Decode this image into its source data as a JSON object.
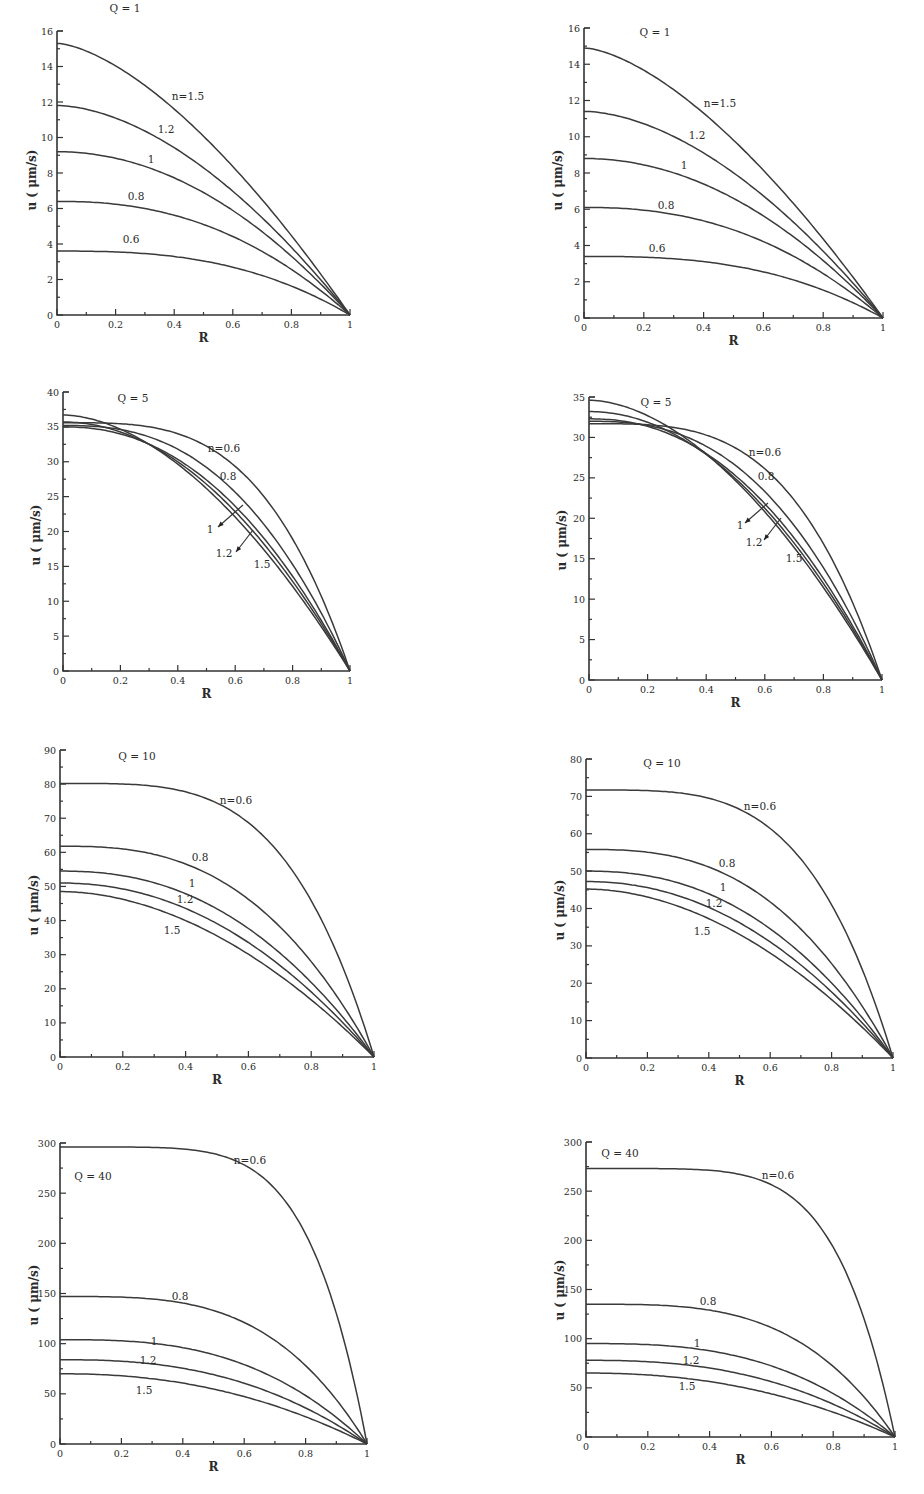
{
  "figure": {
    "layout": "4 rows x 2 columns of line plots",
    "x_axis_label": "R",
    "y_axis_label": "u ( μm/s)"
  },
  "chart_data": [
    {
      "type": "line",
      "panel": "row1-left",
      "title": "Q = 1",
      "xlabel": "R",
      "ylabel": "u ( μm/s)",
      "xlim": [
        0,
        1
      ],
      "ylim": [
        0,
        16
      ],
      "xticks": [
        "0",
        "0.2",
        "0.4",
        "0.6",
        "0.8",
        "1"
      ],
      "yticks": [
        "0",
        "2",
        "4",
        "6",
        "8",
        "10",
        "12",
        "14",
        "16"
      ],
      "grid": false,
      "series": [
        {
          "name": "n=1.5",
          "label": "n=1.5",
          "u0": 15.3,
          "k": 1.55,
          "x": [
            0,
            0.2,
            0.4,
            0.6,
            0.8,
            1
          ],
          "values": [
            15.3,
            14.2,
            12.0,
            8.9,
            4.9,
            0
          ]
        },
        {
          "name": "n=1.2",
          "label": "1.2",
          "u0": 11.8,
          "k": 1.75,
          "x": [
            0,
            0.2,
            0.4,
            0.6,
            0.8,
            1
          ],
          "values": [
            11.8,
            11.1,
            9.6,
            7.2,
            4.0,
            0
          ]
        },
        {
          "name": "n=1",
          "label": "1",
          "u0": 9.2,
          "k": 2.0,
          "x": [
            0,
            0.2,
            0.4,
            0.6,
            0.8,
            1
          ],
          "values": [
            9.2,
            8.8,
            7.7,
            5.9,
            3.3,
            0
          ]
        },
        {
          "name": "n=0.8",
          "label": "0.8",
          "u0": 6.4,
          "k": 2.3,
          "x": [
            0,
            0.2,
            0.4,
            0.6,
            0.8,
            1
          ],
          "values": [
            6.4,
            6.2,
            5.6,
            4.4,
            2.6,
            0
          ]
        },
        {
          "name": "n=0.6",
          "label": "0.6",
          "u0": 3.6,
          "k": 2.7,
          "x": [
            0,
            0.2,
            0.4,
            0.6,
            0.8,
            1
          ],
          "values": [
            3.6,
            3.6,
            3.3,
            2.8,
            1.8,
            0
          ]
        }
      ]
    },
    {
      "type": "line",
      "panel": "row1-right",
      "title": "Q = 1",
      "xlabel": "R",
      "ylabel": "u ( μm/s)",
      "xlim": [
        0,
        1
      ],
      "ylim": [
        0,
        16
      ],
      "xticks": [
        "0",
        "0.2",
        "0.4",
        "0.6",
        "0.8",
        "1"
      ],
      "yticks": [
        "0",
        "2",
        "4",
        "6",
        "8",
        "10",
        "12",
        "14",
        "16"
      ],
      "grid": false,
      "series": [
        {
          "name": "n=1.5",
          "label": "n=1.5",
          "u0": 14.9,
          "k": 1.55,
          "x": [
            0,
            0.2,
            0.4,
            0.6,
            0.8,
            1
          ],
          "values": [
            14.9,
            13.8,
            11.6,
            8.7,
            4.8,
            0
          ]
        },
        {
          "name": "n=1.2",
          "label": "1.2",
          "u0": 11.4,
          "k": 1.75,
          "x": [
            0,
            0.2,
            0.4,
            0.6,
            0.8,
            1
          ],
          "values": [
            11.4,
            10.8,
            9.3,
            7.0,
            3.9,
            0
          ]
        },
        {
          "name": "n=1",
          "label": "1",
          "u0": 8.8,
          "k": 2.0,
          "x": [
            0,
            0.2,
            0.4,
            0.6,
            0.8,
            1
          ],
          "values": [
            8.8,
            8.4,
            7.4,
            5.6,
            3.2,
            0
          ]
        },
        {
          "name": "n=0.8",
          "label": "0.8",
          "u0": 6.1,
          "k": 2.3,
          "x": [
            0,
            0.2,
            0.4,
            0.6,
            0.8,
            1
          ],
          "values": [
            6.1,
            6.0,
            5.4,
            4.2,
            2.5,
            0
          ]
        },
        {
          "name": "n=0.6",
          "label": "0.6",
          "u0": 3.4,
          "k": 2.7,
          "x": [
            0,
            0.2,
            0.4,
            0.6,
            0.8,
            1
          ],
          "values": [
            3.4,
            3.4,
            3.1,
            2.6,
            1.7,
            0
          ]
        }
      ]
    },
    {
      "type": "line",
      "panel": "row2-left",
      "title": "Q = 5",
      "xlabel": "R",
      "ylabel": "u ( μm/s)",
      "xlim": [
        0,
        1
      ],
      "ylim": [
        0,
        40
      ],
      "xticks": [
        "0",
        "0.2",
        "0.4",
        "0.6",
        "0.8",
        "1"
      ],
      "yticks": [
        "0",
        "5",
        "10",
        "15",
        "20",
        "25",
        "30",
        "35",
        "40"
      ],
      "grid": false,
      "series": [
        {
          "name": "n=0.6",
          "label": "n=0.6",
          "u0": 35.6,
          "k": 3.4,
          "x": [
            0,
            0.2,
            0.4,
            0.6,
            0.8,
            1
          ],
          "values": [
            35.6,
            35.5,
            34.5,
            29.5,
            19.5,
            0
          ]
        },
        {
          "name": "n=0.8",
          "label": "0.8",
          "u0": 35.2,
          "k": 2.55,
          "x": [
            0,
            0.2,
            0.4,
            0.6,
            0.8,
            1
          ],
          "values": [
            35.2,
            34.5,
            31.7,
            25.6,
            15.8,
            0
          ]
        },
        {
          "name": "n=1",
          "label": "1",
          "u0": 35.0,
          "k": 2.2,
          "x": [
            0,
            0.2,
            0.4,
            0.6,
            0.8,
            1
          ],
          "values": [
            35.0,
            34.1,
            30.4,
            23.8,
            14.0,
            0
          ]
        },
        {
          "name": "n=1.2",
          "label": "1.2",
          "u0": 35.7,
          "k": 2.0,
          "x": [
            0,
            0.2,
            0.4,
            0.6,
            0.8,
            1
          ],
          "values": [
            35.7,
            34.3,
            30.0,
            22.8,
            12.9,
            0
          ]
        },
        {
          "name": "n=1.5",
          "label": "1.5",
          "u0": 36.7,
          "k": 1.8,
          "x": [
            0,
            0.2,
            0.4,
            0.6,
            0.8,
            1
          ],
          "values": [
            36.7,
            34.8,
            29.7,
            21.7,
            11.6,
            0
          ]
        }
      ],
      "annotations": [
        {
          "text": "1",
          "arrow": true
        },
        {
          "text": "1.2",
          "arrow": true
        }
      ]
    },
    {
      "type": "line",
      "panel": "row2-right",
      "title": "Q = 5",
      "xlabel": "R",
      "ylabel": "u ( μm/s)",
      "xlim": [
        0,
        1
      ],
      "ylim": [
        0,
        35
      ],
      "xticks": [
        "0",
        "0.2",
        "0.4",
        "0.6",
        "0.8",
        "1"
      ],
      "yticks": [
        "0",
        "5",
        "10",
        "15",
        "20",
        "25",
        "30",
        "35"
      ],
      "grid": false,
      "series": [
        {
          "name": "n=0.6",
          "label": "n=0.6",
          "u0": 31.7,
          "k": 3.4,
          "x": [
            0,
            0.2,
            0.4,
            0.6,
            0.8,
            1
          ],
          "values": [
            31.7,
            31.6,
            30.7,
            26.3,
            17.4,
            0
          ]
        },
        {
          "name": "n=0.8",
          "label": "0.8",
          "u0": 32.0,
          "k": 2.55,
          "x": [
            0,
            0.2,
            0.4,
            0.6,
            0.8,
            1
          ],
          "values": [
            32.0,
            31.4,
            28.8,
            23.3,
            14.4,
            0
          ]
        },
        {
          "name": "n=1",
          "label": "1",
          "u0": 32.3,
          "k": 2.2,
          "x": [
            0,
            0.2,
            0.4,
            0.6,
            0.8,
            1
          ],
          "values": [
            32.3,
            31.5,
            28.0,
            21.9,
            12.9,
            0
          ]
        },
        {
          "name": "n=1.2",
          "label": "1.2",
          "u0": 33.2,
          "k": 2.0,
          "x": [
            0,
            0.2,
            0.4,
            0.6,
            0.8,
            1
          ],
          "values": [
            33.2,
            31.9,
            27.9,
            21.2,
            12.0,
            0
          ]
        },
        {
          "name": "n=1.5",
          "label": "1.5",
          "u0": 34.6,
          "k": 1.8,
          "x": [
            0,
            0.2,
            0.4,
            0.6,
            0.8,
            1
          ],
          "values": [
            34.6,
            32.8,
            28.0,
            20.5,
            10.9,
            0
          ]
        }
      ],
      "annotations": [
        {
          "text": "1",
          "arrow": true
        },
        {
          "text": "1.2",
          "arrow": true
        }
      ]
    },
    {
      "type": "line",
      "panel": "row3-left",
      "title": "Q = 10",
      "xlabel": "R",
      "ylabel": "u ( μm/s)",
      "xlim": [
        0,
        1
      ],
      "ylim": [
        0,
        90
      ],
      "xticks": [
        "0",
        "0.2",
        "0.4",
        "0.6",
        "0.8",
        "1"
      ],
      "yticks": [
        "0",
        "10",
        "20",
        "30",
        "40",
        "50",
        "60",
        "70",
        "80",
        "90"
      ],
      "grid": false,
      "series": [
        {
          "name": "n=0.6",
          "label": "n=0.6",
          "u0": 80.2,
          "k": 3.8,
          "x": [
            0,
            0.2,
            0.4,
            0.6,
            0.8,
            1
          ],
          "values": [
            80.2,
            80.0,
            77.9,
            68.2,
            44.2,
            0
          ]
        },
        {
          "name": "n=0.8",
          "label": "0.8",
          "u0": 61.8,
          "k": 2.7,
          "x": [
            0,
            0.2,
            0.4,
            0.6,
            0.8,
            1
          ],
          "values": [
            61.8,
            61.1,
            57.0,
            46.4,
            29.3,
            0
          ]
        },
        {
          "name": "n=1",
          "label": "1",
          "u0": 54.5,
          "k": 2.3,
          "x": [
            0,
            0.2,
            0.4,
            0.6,
            0.8,
            1
          ],
          "values": [
            54.5,
            53.4,
            48.8,
            38.6,
            23.2,
            0
          ]
        },
        {
          "name": "n=1.2",
          "label": "1.2",
          "u0": 51.0,
          "k": 2.1,
          "x": [
            0,
            0.2,
            0.4,
            0.6,
            0.8,
            1
          ],
          "values": [
            51.0,
            49.8,
            44.6,
            34.5,
            20.2,
            0
          ]
        },
        {
          "name": "n=1.5",
          "label": "1.5",
          "u0": 48.5,
          "k": 1.9,
          "x": [
            0,
            0.2,
            0.4,
            0.6,
            0.8,
            1
          ],
          "values": [
            48.5,
            46.9,
            41.2,
            31.3,
            17.8,
            0
          ]
        }
      ]
    },
    {
      "type": "line",
      "panel": "row3-right",
      "title": "Q = 10",
      "xlabel": "R",
      "ylabel": "u ( μm/s)",
      "xlim": [
        0,
        1
      ],
      "ylim": [
        0,
        80
      ],
      "xticks": [
        "0",
        "0.2",
        "0.4",
        "0.6",
        "0.8",
        "1"
      ],
      "yticks": [
        "0",
        "10",
        "20",
        "30",
        "40",
        "50",
        "60",
        "70",
        "80"
      ],
      "grid": false,
      "series": [
        {
          "name": "n=0.6",
          "label": "n=0.6",
          "u0": 71.7,
          "k": 3.8,
          "x": [
            0,
            0.2,
            0.4,
            0.6,
            0.8,
            1
          ],
          "values": [
            71.7,
            71.5,
            69.6,
            61.0,
            39.5,
            0
          ]
        },
        {
          "name": "n=0.8",
          "label": "0.8",
          "u0": 55.8,
          "k": 2.7,
          "x": [
            0,
            0.2,
            0.4,
            0.6,
            0.8,
            1
          ],
          "values": [
            55.8,
            55.2,
            51.5,
            41.9,
            26.5,
            0
          ]
        },
        {
          "name": "n=1",
          "label": "1",
          "u0": 50.0,
          "k": 2.3,
          "x": [
            0,
            0.2,
            0.4,
            0.6,
            0.8,
            1
          ],
          "values": [
            50.0,
            49.0,
            44.8,
            35.4,
            21.3,
            0
          ]
        },
        {
          "name": "n=1.2",
          "label": "1.2",
          "u0": 47.2,
          "k": 2.1,
          "x": [
            0,
            0.2,
            0.4,
            0.6,
            0.8,
            1
          ],
          "values": [
            47.2,
            46.1,
            41.3,
            31.9,
            18.7,
            0
          ]
        },
        {
          "name": "n=1.5",
          "label": "1.5",
          "u0": 45.2,
          "k": 1.9,
          "x": [
            0,
            0.2,
            0.4,
            0.6,
            0.8,
            1
          ],
          "values": [
            45.2,
            43.7,
            38.4,
            29.2,
            16.6,
            0
          ]
        }
      ]
    },
    {
      "type": "line",
      "panel": "row4-left",
      "title": "Q = 40",
      "xlabel": "R",
      "ylabel": "u ( μm/s)",
      "xlim": [
        0,
        1
      ],
      "ylim": [
        0,
        300
      ],
      "xticks": [
        "0",
        "0.2",
        "0.4",
        "0.6",
        "0.8",
        "1"
      ],
      "yticks": [
        "0",
        "50",
        "100",
        "150",
        "200",
        "250",
        "300"
      ],
      "grid": false,
      "series": [
        {
          "name": "n=0.6",
          "label": "n=0.6",
          "u0": 296,
          "k": 5.5,
          "x": [
            0,
            0.2,
            0.4,
            0.6,
            0.8,
            1
          ],
          "values": [
            296,
            296,
            291,
            268,
            196,
            0
          ]
        },
        {
          "name": "n=0.8",
          "label": "0.8",
          "u0": 147,
          "k": 3.4,
          "x": [
            0,
            0.2,
            0.4,
            0.6,
            0.8,
            1
          ],
          "values": [
            147,
            147,
            142,
            122,
            80,
            0
          ]
        },
        {
          "name": "n=1",
          "label": "1",
          "u0": 104,
          "k": 2.8,
          "x": [
            0,
            0.2,
            0.4,
            0.6,
            0.8,
            1
          ],
          "values": [
            104,
            103,
            97,
            80,
            50,
            0
          ]
        },
        {
          "name": "n=1.2",
          "label": "1.2",
          "u0": 84,
          "k": 2.5,
          "x": [
            0,
            0.2,
            0.4,
            0.6,
            0.8,
            1
          ],
          "values": [
            84,
            83,
            76,
            60,
            36,
            0
          ]
        },
        {
          "name": "n=1.5",
          "label": "1.5",
          "u0": 70,
          "k": 2.2,
          "x": [
            0,
            0.2,
            0.4,
            0.6,
            0.8,
            1
          ],
          "values": [
            70,
            68,
            61,
            48,
            27,
            0
          ]
        }
      ]
    },
    {
      "type": "line",
      "panel": "row4-right",
      "title": "Q = 40",
      "xlabel": "R",
      "ylabel": "u ( μm/s)",
      "xlim": [
        0,
        1
      ],
      "ylim": [
        0,
        300
      ],
      "xticks": [
        "0",
        "0.2",
        "0.4",
        "0.6",
        "0.8",
        "1"
      ],
      "yticks": [
        "0",
        "50",
        "100",
        "150",
        "200",
        "250",
        "300"
      ],
      "grid": false,
      "series": [
        {
          "name": "n=0.6",
          "label": "n=0.6",
          "u0": 273,
          "k": 5.5,
          "x": [
            0,
            0.2,
            0.4,
            0.6,
            0.8,
            1
          ],
          "values": [
            273,
            273,
            269,
            247,
            181,
            0
          ]
        },
        {
          "name": "n=0.8",
          "label": "0.8",
          "u0": 135,
          "k": 3.4,
          "x": [
            0,
            0.2,
            0.4,
            0.6,
            0.8,
            1
          ],
          "values": [
            135,
            135,
            130,
            112,
            73,
            0
          ]
        },
        {
          "name": "n=1",
          "label": "1",
          "u0": 95,
          "k": 2.8,
          "x": [
            0,
            0.2,
            0.4,
            0.6,
            0.8,
            1
          ],
          "values": [
            95,
            94,
            89,
            73,
            45,
            0
          ]
        },
        {
          "name": "n=1.2",
          "label": "1.2",
          "u0": 78,
          "k": 2.5,
          "x": [
            0,
            0.2,
            0.4,
            0.6,
            0.8,
            1
          ],
          "values": [
            78,
            77,
            70,
            56,
            33,
            0
          ]
        },
        {
          "name": "n=1.5",
          "label": "1.5",
          "u0": 65,
          "k": 2.2,
          "x": [
            0,
            0.2,
            0.4,
            0.6,
            0.8,
            1
          ],
          "values": [
            65,
            63,
            57,
            44,
            25,
            0
          ]
        }
      ]
    }
  ]
}
